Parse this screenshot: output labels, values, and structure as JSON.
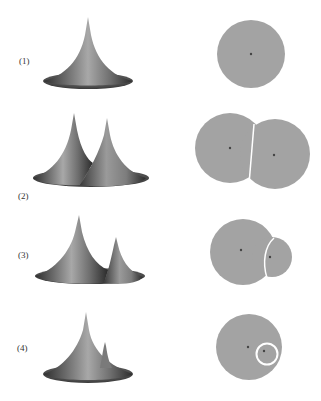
{
  "rows": [
    {
      "label": "(1)",
      "label_pos": [
        19,
        60
      ]
    },
    {
      "label": "(2)",
      "label_pos": [
        18,
        196
      ]
    },
    {
      "label": "(3)",
      "label_pos": [
        18,
        254
      ]
    },
    {
      "label": "(4)",
      "label_pos": [
        17,
        348
      ]
    }
  ],
  "colors": {
    "disk_fill": "#a3a3a3",
    "boundary": "#ffffff",
    "center_dot": "#444444",
    "surface_dark": "#2e2e2e",
    "surface_mid": "#7a7a7a",
    "surface_light": "#b5b5b5"
  }
}
